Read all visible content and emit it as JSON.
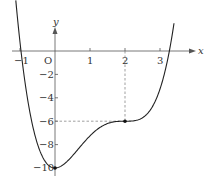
{
  "figure": {
    "axes": {
      "x_label": "x",
      "y_label": "y",
      "origin_label": "O",
      "x_ticks": [
        {
          "value": -1,
          "label": "−1"
        },
        {
          "value": 1,
          "label": "1"
        },
        {
          "value": 2,
          "label": "2"
        },
        {
          "value": 3,
          "label": "3"
        }
      ],
      "y_ticks": [
        {
          "value": -2,
          "label": "−2"
        },
        {
          "value": -4,
          "label": "−4"
        },
        {
          "value": -6,
          "label": "−6"
        },
        {
          "value": -8,
          "label": "−8"
        },
        {
          "value": -10,
          "label": "−10"
        }
      ]
    },
    "curve": {
      "description": "quartic curve with minimum at (0,-10) and horizontal inflection at (2,-6)",
      "points_marked": [
        {
          "x": 0,
          "y": -10
        },
        {
          "x": 2,
          "y": -6
        }
      ]
    },
    "guide_lines": [
      {
        "type": "dashed",
        "from": [
          2,
          0
        ],
        "to": [
          2,
          -6
        ]
      },
      {
        "type": "dashed",
        "from": [
          0,
          -6
        ],
        "to": [
          2,
          -6
        ]
      }
    ],
    "colors": {
      "curve": "#222222",
      "axis": "#555555",
      "dash": "#777777"
    }
  }
}
